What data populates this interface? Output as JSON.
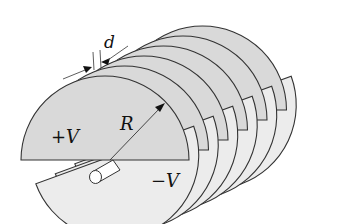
{
  "figure": {
    "labels": {
      "spacing": "d",
      "radius": "R",
      "positive": "+V",
      "negative": "−V"
    },
    "plate_count_positive": 6,
    "plate_count_negative": 6,
    "colors": {
      "positive_plate": "#d9d9d9",
      "negative_plate": "#ececec",
      "outline": "#333333"
    }
  }
}
